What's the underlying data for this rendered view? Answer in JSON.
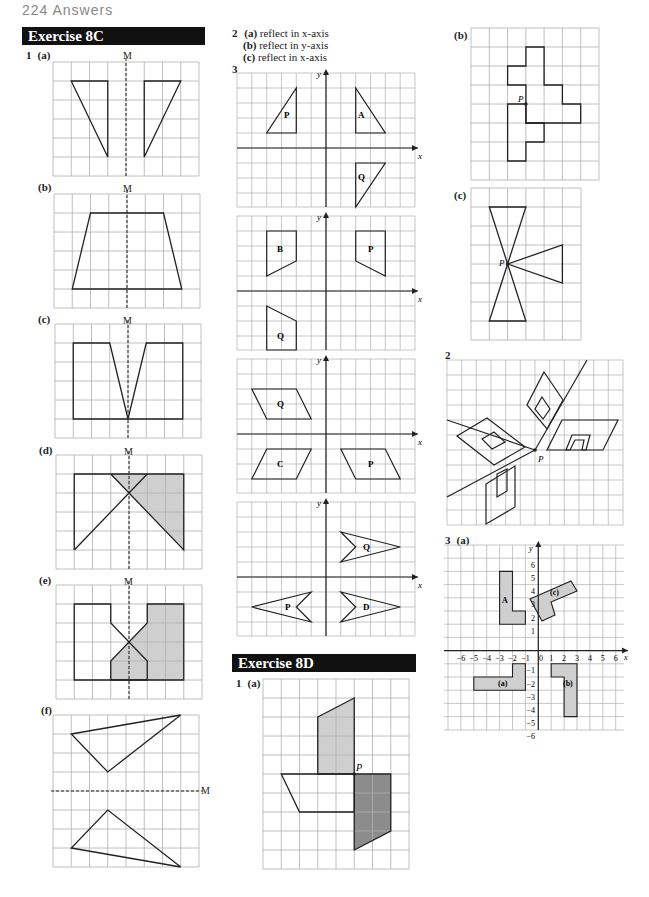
{
  "page_header": "224  Answers",
  "exercise_8c": {
    "title": "Exercise 8C",
    "q1": {
      "number": "1",
      "parts": [
        {
          "label": "(a)",
          "mirror_label": "M"
        },
        {
          "label": "(b)",
          "mirror_label": "M"
        },
        {
          "label": "(c)",
          "mirror_label": "M"
        },
        {
          "label": "(d)",
          "mirror_label": "M"
        },
        {
          "label": "(e)",
          "mirror_label": "M"
        },
        {
          "label": "(f)",
          "mirror_label": "M"
        }
      ]
    },
    "q2": {
      "number": "2",
      "answers": [
        {
          "label": "(a)",
          "text": "reflect in x-axis"
        },
        {
          "label": "(b)",
          "text": "reflect in y-axis"
        },
        {
          "label": "(c)",
          "text": "reflect in x-axis"
        }
      ]
    },
    "q3": {
      "number": "3",
      "axis_x": "x",
      "axis_y": "y",
      "grid1_shapes": [
        "P",
        "A",
        "Q"
      ],
      "grid2_shapes": [
        "B",
        "P",
        "Q"
      ],
      "grid3_shapes": [
        "Q",
        "C",
        "P"
      ],
      "grid4_shapes": [
        "Q",
        "P",
        "D"
      ]
    }
  },
  "exercise_8d": {
    "title": "Exercise 8D",
    "q1": {
      "number": "1",
      "parts": [
        {
          "label": "(a)",
          "point_label": "P"
        },
        {
          "label": "(b)",
          "point_label": "P"
        },
        {
          "label": "(c)",
          "point_label": "P"
        }
      ]
    },
    "q2": {
      "number": "2",
      "point_label": "P"
    },
    "q3": {
      "number": "3",
      "part_label": "(a)",
      "axis_x": "x",
      "axis_y": "y",
      "origin": "0",
      "x_ticks": [
        "−6",
        "−5",
        "−4",
        "−3",
        "−2",
        "−1",
        "1",
        "2",
        "3",
        "4",
        "5",
        "6"
      ],
      "y_ticks": [
        "6",
        "5",
        "4",
        "3",
        "2",
        "1",
        "−1",
        "−2",
        "−3",
        "−4",
        "−5",
        "−6"
      ],
      "shape_labels": [
        "A",
        "(a)",
        "(b)",
        "(c)"
      ]
    }
  },
  "colors": {
    "banner_bg": "#111111",
    "grid_line": "#b0b0b0",
    "shape_stroke": "#222222",
    "shade_light": "#cfcfcf",
    "shade_dark": "#8c8c8c"
  }
}
